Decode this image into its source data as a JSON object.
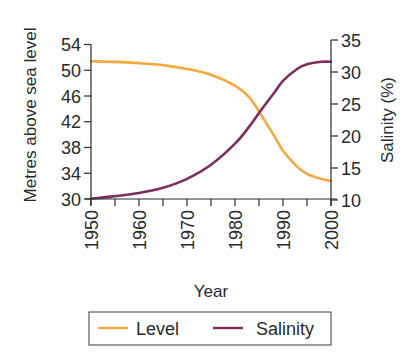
{
  "chart_data": {
    "type": "line",
    "title": "",
    "xlabel": "Year",
    "ylabel": "Metres above sea level",
    "y2label": "Salinity (%)",
    "xlim": [
      1950,
      2000
    ],
    "ylim": [
      30,
      54
    ],
    "y2lim": [
      10,
      35
    ],
    "x_ticks": [
      1950,
      1960,
      1970,
      1980,
      1990,
      2000
    ],
    "x_minor_step": 5,
    "y_ticks": [
      30,
      34,
      38,
      42,
      46,
      50,
      54
    ],
    "y2_ticks": [
      10,
      15,
      20,
      25,
      30,
      35
    ],
    "grid": false,
    "legend_position": "bottom",
    "x": [
      1950,
      1955,
      1960,
      1965,
      1970,
      1975,
      1980,
      1983,
      1985,
      1988,
      1990,
      1993,
      1995,
      1998,
      2000
    ],
    "series": [
      {
        "name": "Level",
        "axis": "left",
        "color": "#F4A940",
        "values": [
          51.4,
          51.3,
          51.1,
          50.8,
          50.2,
          49.3,
          47.6,
          45.8,
          43.6,
          40.0,
          37.5,
          35.0,
          33.9,
          33.1,
          32.8
        ]
      },
      {
        "name": "Salinity",
        "axis": "right",
        "color": "#7B2D5E",
        "values": [
          10.2,
          10.6,
          11.1,
          11.9,
          13.3,
          15.5,
          18.8,
          21.5,
          23.6,
          26.6,
          28.6,
          30.5,
          31.2,
          31.6,
          31.6
        ]
      }
    ]
  },
  "labels": {
    "xlabel": "Year",
    "ylabel": "Metres above sea level",
    "y2label": "Salinity (%)",
    "legend": [
      {
        "label": "Level",
        "color": "#F4A940"
      },
      {
        "label": "Salinity",
        "color": "#7B2D5E"
      }
    ]
  }
}
